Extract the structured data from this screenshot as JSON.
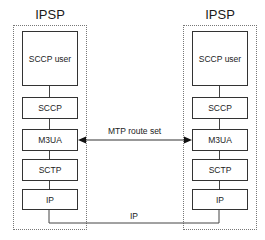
{
  "diagram": {
    "nodes": {
      "left": {
        "title": "IPSP",
        "layers": [
          "SCCP user",
          "SCCP",
          "M3UA",
          "SCTP",
          "IP"
        ]
      },
      "right": {
        "title": "IPSP",
        "layers": [
          "SCCP user",
          "SCCP",
          "M3UA",
          "SCTP",
          "IP"
        ]
      }
    },
    "connections": [
      {
        "from": "left.M3UA",
        "to": "right.M3UA",
        "label": "MTP route set",
        "style": "double-arrow"
      },
      {
        "from": "left.IP",
        "to": "right.IP",
        "label": "IP",
        "style": "line"
      }
    ]
  }
}
